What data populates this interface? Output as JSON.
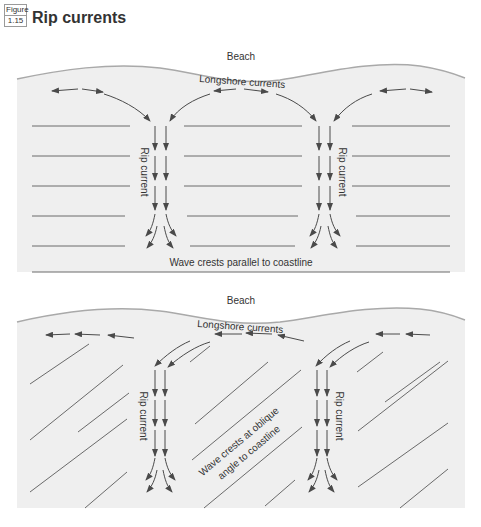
{
  "figure": {
    "label_top": "Figure",
    "label_number": "1.15",
    "title": "Rip currents"
  },
  "colors": {
    "water": "#efefef",
    "beach": "#ffffff",
    "shoreline": "#a9a9a9",
    "arrow": "#4a4a4a",
    "wave_line": "#6a6a6a",
    "text": "#333333"
  },
  "panels": [
    {
      "id": "parallel",
      "beach_label": "Beach",
      "longshore_label": "Longshore currents",
      "rip_labels": [
        "Rip current",
        "Rip current"
      ],
      "wave_label": "Wave crests parallel to coastline"
    },
    {
      "id": "oblique",
      "beach_label": "Beach",
      "longshore_label": "Longshore currents",
      "rip_labels": [
        "Rip current",
        "Rip current"
      ],
      "wave_label_line1": "Wave crests at oblique",
      "wave_label_line2": "angle to coastline"
    }
  ]
}
